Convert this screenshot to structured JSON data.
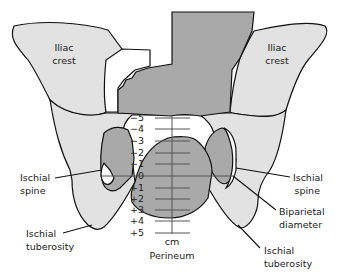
{
  "diagram": {
    "type": "fetal-station-pelvis",
    "colors": {
      "bone": "#e2e2e2",
      "fetal_head": "#a9a9a9",
      "outline": "#111111",
      "scale": "#555555"
    },
    "labels": {
      "iliac_crest_left": [
        "Iliac",
        "crest"
      ],
      "iliac_crest_right": [
        "Iliac",
        "crest"
      ],
      "ischial_spine_left": [
        "Ischial",
        "spine"
      ],
      "ischial_spine_right": [
        "Ischial",
        "spine"
      ],
      "ischial_tuberosity_left": [
        "Ischial",
        "tuberosity"
      ],
      "ischial_tuberosity_right": [
        "Ischial",
        "tuberosity"
      ],
      "biparietal_diameter": [
        "Biparietal",
        "diameter"
      ],
      "unit": "cm",
      "perineum": "Perineum"
    },
    "stations": [
      "−5",
      "−4",
      "−3",
      "−2",
      "−1",
      "0",
      "+1",
      "+2",
      "+3",
      "+4",
      "+5"
    ]
  }
}
